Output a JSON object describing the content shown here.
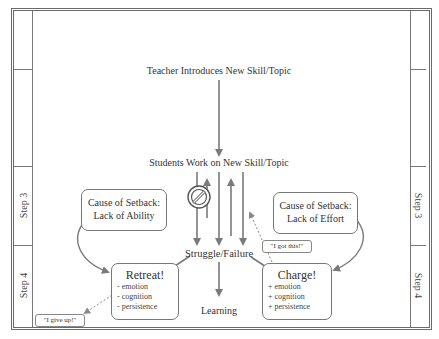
{
  "diagram": {
    "top_node": "Teacher Introduces New Skill/Topic",
    "work_node": "Students Work on New Skill/Topic",
    "struggle_node": "Struggle/Failure",
    "learning_node": "Learning",
    "blocked_icon": "no-entry-icon",
    "left_path": {
      "cause_line1": "Cause of Setback:",
      "cause_line2": "Lack of Ability",
      "outcome_title": "Retreat!",
      "outcome_items": [
        "- emotion",
        "- cognition",
        "- persistence"
      ],
      "quote": "\"I give up!\""
    },
    "right_path": {
      "cause_line1": "Cause of Setback:",
      "cause_line2": "Lack of Effort",
      "outcome_title": "Charge!",
      "outcome_items": [
        "+ emotion",
        "+ cognition",
        "+ persistence"
      ],
      "quote": "\"I got this!\""
    },
    "side_labels": {
      "left": [
        "Step 3",
        "Step 4"
      ],
      "right": [
        "Step 3",
        "Step 4"
      ]
    },
    "colors": {
      "arrow": "#7a7a7a",
      "border": "#6a6a6a",
      "text": "#333333"
    }
  }
}
